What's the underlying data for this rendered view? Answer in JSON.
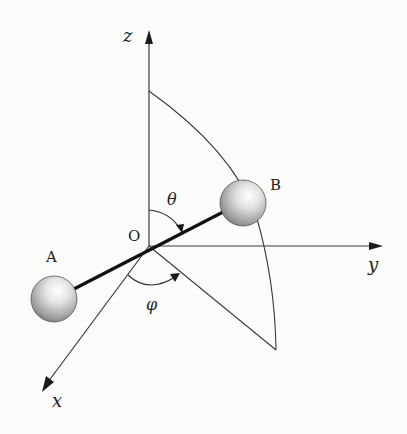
{
  "diagram": {
    "axes": {
      "x": "x",
      "y": "y",
      "z": "z"
    },
    "origin_label": "O",
    "atoms": {
      "a": "A",
      "b": "B"
    },
    "angles": {
      "polar": "θ",
      "azimuthal": "φ"
    },
    "colors": {
      "line": "#3a3a3a",
      "bond": "#111111",
      "sphere_light": "#ffffff",
      "sphere_dark": "#7a7a7a"
    }
  }
}
